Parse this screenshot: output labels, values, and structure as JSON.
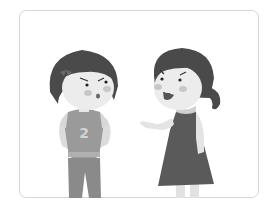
{
  "image": {
    "description": "Grayscale illustration of two girls arguing inside a rounded frame",
    "jersey_number": "2",
    "colors": {
      "hair": "#4a4a4a",
      "skin": "#ececec",
      "cheek": "#c8c8c8",
      "shirt": "#9a9a9a",
      "sleeve": "#d8d8d8",
      "pants": "#8a8a8a",
      "dress": "#5a5a5a",
      "frame": "#d6d6d6"
    }
  }
}
